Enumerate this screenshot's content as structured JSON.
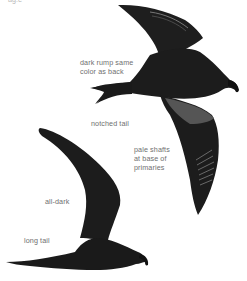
{
  "figure": {
    "colors": {
      "bird_body": "#1c1c1c",
      "underwing_pale": "#5a5a5a",
      "label_text": "#6f6f6f",
      "background": "#ffffff"
    }
  },
  "labels": {
    "top_cut": "ag.e",
    "dark_rump": "dark rump same\ncolor as back",
    "notched_tail": "notched tail",
    "pale_shafts": "pale shafts\nat base of\nprimaries",
    "all_dark": "all-dark",
    "long_tail": "long tail"
  }
}
